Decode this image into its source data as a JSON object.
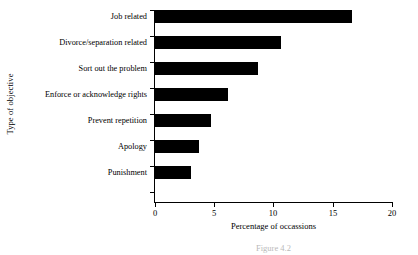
{
  "chart_data": {
    "type": "bar",
    "orientation": "horizontal",
    "title": "",
    "xlabel": "Percentage of occassions",
    "ylabel": "Type of objective",
    "categories": [
      "Job related",
      "Divorce/separation related",
      "Sort out the problem",
      "Enforce or acknowledge rights",
      "Prevent repetition",
      "Apology",
      "Punishment"
    ],
    "values": [
      16.6,
      10.6,
      8.7,
      6.2,
      4.7,
      3.7,
      3.0
    ],
    "xlim": [
      0,
      20
    ],
    "xticks": [
      0,
      5,
      10,
      15,
      20
    ],
    "xtick_labels": [
      "0",
      "5",
      "10",
      "15",
      "20"
    ],
    "grid": false,
    "legend": false,
    "bar_color": "#000000"
  },
  "caption": "Figure 4.2"
}
